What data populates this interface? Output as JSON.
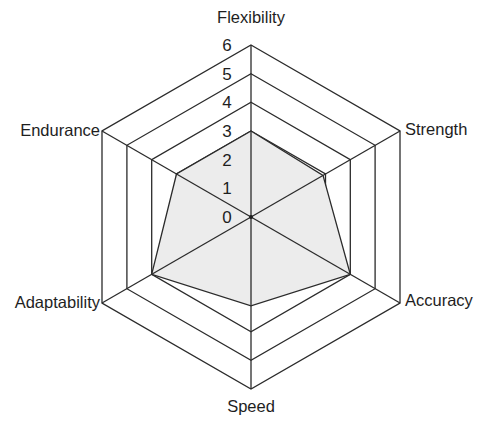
{
  "chart_data": {
    "type": "radar",
    "title": "",
    "axes": [
      "Flexibility",
      "Strength",
      "Accuracy",
      "Speed",
      "Adaptability",
      "Endurance"
    ],
    "series": [
      {
        "name": "Series 1",
        "values": [
          3,
          2.9,
          4,
          3.1,
          4,
          3
        ]
      }
    ],
    "radial_ticks": [
      "0",
      "1",
      "2",
      "3",
      "4",
      "5",
      "6"
    ],
    "rmax": 6,
    "grid": true,
    "grid_shape": "hexagon",
    "legend": "none",
    "colors": {
      "fill": "#ececec",
      "line": "#2b2b2b",
      "text": "#1e1e1e"
    }
  }
}
